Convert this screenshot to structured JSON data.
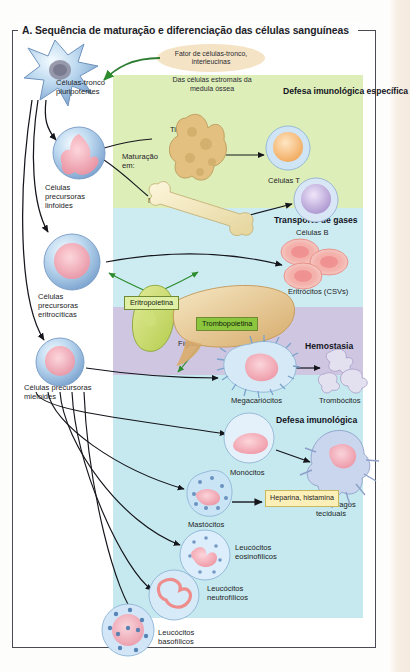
{
  "figure": {
    "title": "A. Sequência de maturação e diferenciação das células sanguíneas"
  },
  "stimulus": {
    "oval_line1": "Fator de células-tronco,",
    "oval_line2": "interleucinas",
    "source_note": "Das células estromais\nda medula óssea"
  },
  "precursors": [
    {
      "label": "Células-tronco\npluripotentes"
    },
    {
      "label": "Células\nprecursoras\nlinfoides"
    },
    {
      "label": "Células\nprecursoras\neritrocíticas"
    },
    {
      "label": "Células precursoras\nmieloides"
    }
  ],
  "bands": [
    {
      "name": "lymphoid",
      "title": "Defesa imunológica\nespecífica",
      "color": "#ddeeb8"
    },
    {
      "name": "erythroid",
      "title": "Transporte de gases",
      "color": "#cdecf2"
    },
    {
      "name": "hemostasis",
      "title": "Hemostasia",
      "color": "#cfc7e2"
    },
    {
      "name": "immune",
      "title": "Defesa imunológica",
      "color": "#c5e9ee"
    }
  ],
  "lymphoid": {
    "maturation_label": "Maturação\nem:",
    "thymus": "Timo",
    "bone_marrow": "Medula óssea",
    "t_cells": "Células T",
    "b_cells": "Células B"
  },
  "erythroid": {
    "erythropoietin": "Eritropoietina",
    "kidney": "Rins",
    "erythrocytes": "Eritrócitos (CSVs)"
  },
  "hemostasis": {
    "thrombopoietin": "Trombopoietina",
    "liver": "Fígado",
    "megakaryocytes": "Megacariócitos",
    "thrombocytes": "Trombócitos"
  },
  "immune": {
    "monocytes": "Monócitos",
    "macrophages": "Macrófagos\nteciduais",
    "mast_cells": "Mastócitos",
    "mediators": "Heparina,\nhistamina",
    "eosinophils": "Leucócitos\neosinofílicos",
    "neutrophils": "Leucócitos\nneutrofílicos",
    "basophils": "Leucócitos\nbasofílicos"
  }
}
